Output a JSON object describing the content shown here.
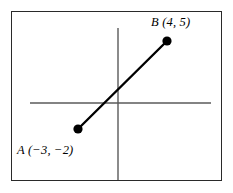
{
  "figure": {
    "background_color": "#ffffff",
    "frame": {
      "border_color": "#2a2a2a",
      "x": 11,
      "y": 11,
      "width": 211,
      "height": 170
    },
    "axes": {
      "color": "#5a5a5a",
      "x_axis": {
        "x1": 30,
        "y1": 103,
        "x2": 211,
        "y2": 103
      },
      "y_axis": {
        "x1": 118,
        "y1": 28,
        "x2": 118,
        "y2": 180
      }
    },
    "segment": {
      "color": "#000000",
      "width": 2.4,
      "from": {
        "px": 78,
        "py": 129
      },
      "to": {
        "px": 167,
        "py": 41
      }
    },
    "points": [
      {
        "name": "A",
        "label": "A (−3, −2)",
        "x": -3,
        "y": -2,
        "marker_color": "#000000",
        "marker_radius": 4.6,
        "px": 78,
        "py": 129
      },
      {
        "name": "B",
        "label": "B (4, 5)",
        "x": 4,
        "y": 5,
        "marker_color": "#000000",
        "marker_radius": 4.6,
        "px": 167,
        "py": 41
      }
    ]
  }
}
